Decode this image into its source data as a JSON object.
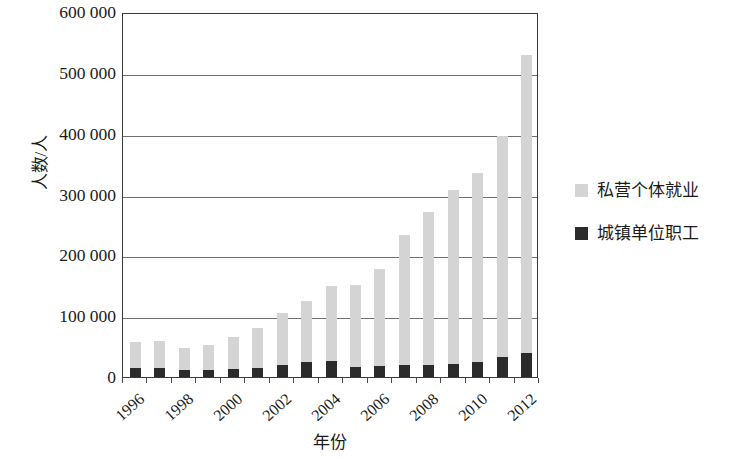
{
  "chart_data": {
    "type": "bar",
    "subtype": "stacked",
    "title": "",
    "xlabel": "年份",
    "ylabel": "人数/人",
    "ylim": [
      0,
      600000
    ],
    "ytick_labels": [
      "600 000",
      "500 000",
      "400 000",
      "300 000",
      "200 000",
      "100 000",
      "0"
    ],
    "ytick_values": [
      600000,
      500000,
      400000,
      300000,
      200000,
      100000,
      0
    ],
    "grid": true,
    "legend_position": "right",
    "categories": [
      1996,
      1997,
      1998,
      1999,
      2000,
      2001,
      2002,
      2003,
      2004,
      2005,
      2006,
      2007,
      2008,
      2009,
      2010,
      2011,
      2012
    ],
    "xtick_labels": [
      "1996",
      "1998",
      "2000",
      "2002",
      "2004",
      "2006",
      "2008",
      "2010",
      "2012"
    ],
    "series": [
      {
        "name": "城镇单位职工",
        "color": "#2b2b2b",
        "values": [
          14000,
          14000,
          11000,
          12000,
          13000,
          15000,
          19000,
          25000,
          27000,
          17000,
          18000,
          19000,
          20000,
          21000,
          25000,
          33000,
          40000
        ]
      },
      {
        "name": "私营个体就业",
        "color": "#d4d4d4",
        "values": [
          44000,
          45000,
          37000,
          41000,
          52000,
          65000,
          87000,
          100000,
          122000,
          135000,
          160000,
          214000,
          252000,
          286000,
          310000,
          364000,
          490000
        ]
      }
    ],
    "totals": [
      58000,
      59000,
      48000,
      53000,
      65000,
      80000,
      106000,
      125000,
      149000,
      152000,
      178000,
      233000,
      272000,
      307000,
      335000,
      397000,
      530000
    ]
  },
  "legend": {
    "entries": [
      {
        "label": "私营个体就业",
        "color": "#d4d4d4"
      },
      {
        "label": "城镇单位职工",
        "color": "#2b2b2b"
      }
    ]
  },
  "axes": {
    "y_title": "人数/人",
    "x_title": "年份"
  }
}
